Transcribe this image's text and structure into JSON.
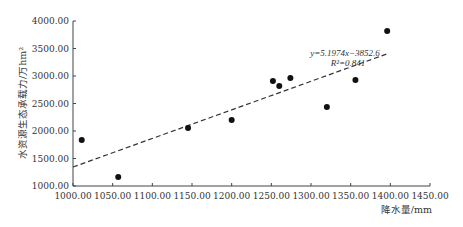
{
  "chart_data": {
    "type": "scatter",
    "title": "",
    "xlabel": "降水量/mm",
    "ylabel": "水资源生态承载力/万hm²",
    "xlim": [
      1000,
      1450
    ],
    "ylim": [
      1000,
      4000
    ],
    "x_ticks": [
      "1000.00",
      "1050.00",
      "1100.00",
      "1150.00",
      "1200.00",
      "1250.00",
      "1300.00",
      "1350.00",
      "1400.00",
      "1450.00"
    ],
    "y_ticks": [
      "1000.00",
      "1500.00",
      "2000.00",
      "2500.00",
      "3000.00",
      "3500.00",
      "4000.00"
    ],
    "grid": false,
    "legend": null,
    "series": [
      {
        "name": "observed",
        "points": [
          {
            "x": 1011,
            "y": 1836
          },
          {
            "x": 1057,
            "y": 1164
          },
          {
            "x": 1145,
            "y": 2055
          },
          {
            "x": 1200,
            "y": 2200
          },
          {
            "x": 1252,
            "y": 2909
          },
          {
            "x": 1260,
            "y": 2818
          },
          {
            "x": 1274,
            "y": 2964
          },
          {
            "x": 1320,
            "y": 2436
          },
          {
            "x": 1356,
            "y": 2927
          },
          {
            "x": 1396,
            "y": 3818
          }
        ]
      }
    ],
    "trendline": {
      "type": "linear",
      "slope": 5.1974,
      "intercept": -3852.6,
      "x_range": [
        1000,
        1395
      ],
      "style": "dashed"
    },
    "annotations": {
      "equation": "y=5.1974x−3852.6",
      "r_squared": "R²=0.841"
    }
  }
}
